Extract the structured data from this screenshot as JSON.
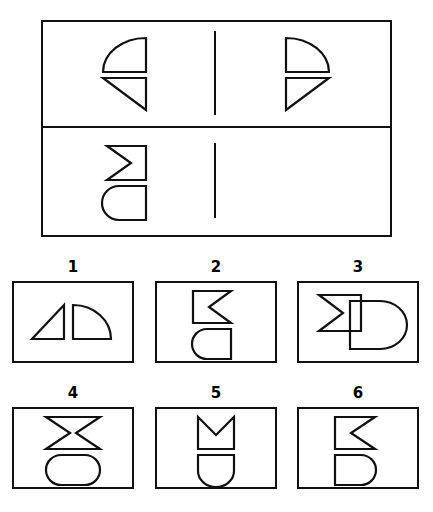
{
  "page": {
    "kind": "spatial-reasoning-test-item",
    "background_color": "#ffffff",
    "ink_color": "#111111",
    "width": 433,
    "height": 512
  },
  "stimulus": {
    "name": "stimulus-panel",
    "rows": [
      {
        "row_index": 1,
        "left_cell": {
          "name": "stimulus-row1-left",
          "shapes": [
            {
              "id": "quarter-circle-arc-top-left",
              "type": "quarter-circle",
              "arc_side": "top-left",
              "description": "quarter circle with convex arc sweeping from upper-right down to lower-left, flat right edge and flat bottom edge"
            },
            {
              "id": "right-triangle-hypotenuse-top-left",
              "type": "right-triangle",
              "right_angle_corner": "bottom-right",
              "description": "right triangle with hypotenuse running from top-left down to bottom-right, vertical right leg and horizontal top leg"
            }
          ]
        },
        "right_cell": {
          "name": "stimulus-row1-right",
          "shapes": [
            {
              "id": "quarter-circle-arc-top-right",
              "type": "quarter-circle",
              "arc_side": "top-right",
              "description": "mirror image quarter circle, convex arc on the right, flat left edge and flat bottom edge"
            },
            {
              "id": "right-triangle-hypotenuse-top-right",
              "type": "right-triangle",
              "right_angle_corner": "bottom-left",
              "description": "mirror image right triangle, hypotenuse from top-right down to bottom-left"
            }
          ]
        },
        "relation": "mirror-reflection-left-to-right"
      },
      {
        "row_index": 2,
        "left_cell": {
          "name": "stimulus-row2-left",
          "shapes": [
            {
              "id": "chevron-notch-left",
              "type": "chevron-block",
              "notch_side": "left",
              "description": "rectangle with a V shaped notch cut into its left edge, point of the V aiming right"
            },
            {
              "id": "d-shape-round-left",
              "type": "d-shape",
              "round_side": "left",
              "description": "D shape with semicircular bulge on the left and flat vertical edge on the right"
            }
          ]
        },
        "right_cell": {
          "name": "stimulus-row2-right",
          "shapes": [],
          "is_blank": true,
          "description": "empty cell - the answer goes here"
        },
        "relation": "apply-same-mirror-reflection"
      }
    ]
  },
  "options": {
    "name": "answer-options",
    "items": [
      {
        "label": "1",
        "name": "answer-option-1",
        "art": "triangle-and-quarter-circle-side-by-side",
        "shapes": [
          {
            "id": "right-triangle-hypotenuse-top-left",
            "type": "right-triangle",
            "description": "small right triangle, hypotenuse from top-right down to bottom-left, placed on the left"
          },
          {
            "id": "quarter-circle-arc-top-right",
            "type": "quarter-circle",
            "description": "quarter circle with arc on the upper right, placed on the right"
          }
        ]
      },
      {
        "label": "2",
        "name": "answer-option-2",
        "art": "chevron-notch-right-over-d-shape-round-left",
        "shapes": [
          {
            "id": "chevron-notch-right",
            "type": "chevron-block",
            "notch_side": "right",
            "description": "rectangle with V notch cut into its right edge"
          },
          {
            "id": "d-shape-round-left",
            "type": "d-shape",
            "round_side": "left",
            "description": "D shape rounded on the left, flat on the right"
          }
        ]
      },
      {
        "label": "3",
        "name": "answer-option-3",
        "art": "overlapping-chevron-and-d-shape",
        "shapes": [
          {
            "id": "chevron-notch-left",
            "type": "chevron-block",
            "notch_side": "left",
            "description": "chevron block overlapping the D shape"
          },
          {
            "id": "d-shape-round-right",
            "type": "d-shape",
            "round_side": "right",
            "description": "D shape rounded on the right, overlapped by the chevron"
          }
        ]
      },
      {
        "label": "4",
        "name": "answer-option-4",
        "art": "bowtie-over-stadium",
        "shapes": [
          {
            "id": "bowtie",
            "type": "bowtie",
            "description": "hourglass / bowtie shape with notches cut into both left and right edges"
          },
          {
            "id": "stadium",
            "type": "stadium",
            "description": "rounded rectangle with semicircular caps on both left and right"
          }
        ]
      },
      {
        "label": "5",
        "name": "answer-option-5",
        "art": "chevron-notch-top-over-u-shape",
        "shapes": [
          {
            "id": "chevron-notch-top",
            "type": "chevron-block",
            "notch_side": "top",
            "description": "rectangle with V notch cut into its top edge"
          },
          {
            "id": "u-shape-round-bottom",
            "type": "d-shape",
            "round_side": "bottom",
            "description": "U shape, flat top and rounded bottom"
          }
        ]
      },
      {
        "label": "6",
        "name": "answer-option-6",
        "art": "chevron-notch-right-over-d-shape-round-right",
        "shapes": [
          {
            "id": "chevron-notch-right",
            "type": "chevron-block",
            "notch_side": "right",
            "description": "rectangle with V notch cut into its right edge"
          },
          {
            "id": "d-shape-round-right",
            "type": "d-shape",
            "round_side": "right",
            "description": "D shape rounded on the right, flat on the left"
          }
        ]
      }
    ]
  }
}
